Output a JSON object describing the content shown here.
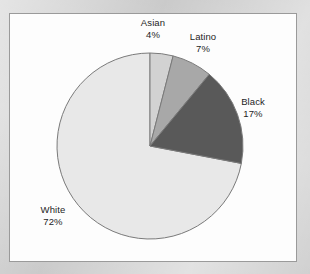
{
  "chart_data": {
    "type": "pie",
    "title": "",
    "subtitle": "",
    "xlabel": "",
    "ylabel": "",
    "legend_position": "none",
    "grid": false,
    "start_angle_deg": 0,
    "direction": "clockwise",
    "categories": [
      "Asian",
      "Latino",
      "Black",
      "White"
    ],
    "values": [
      4,
      7,
      17,
      72
    ],
    "units": "percent",
    "total": 100,
    "slices": [
      {
        "label": "Asian",
        "value": 4,
        "value_text": "4%",
        "color": "#d2d2d2",
        "label_position": "top"
      },
      {
        "label": "Latino",
        "value": 7,
        "value_text": "7%",
        "color": "#a8a8a8",
        "label_position": "top-right"
      },
      {
        "label": "Black",
        "value": 17,
        "value_text": "17%",
        "color": "#595959",
        "label_position": "right"
      },
      {
        "label": "White",
        "value": 72,
        "value_text": "72%",
        "color": "#e8e8e8",
        "label_position": "bottom-left"
      }
    ],
    "slice_outline_color": "#7a7a7a"
  },
  "frame": {
    "background": "#fdfdfd",
    "border_color": "#9a9a9a",
    "page_background": "#cdcdcd"
  }
}
